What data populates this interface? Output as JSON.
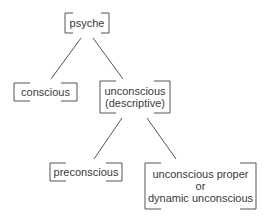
{
  "diagram": {
    "nodes": [
      {
        "id": "psyche",
        "lines": [
          "psyche"
        ]
      },
      {
        "id": "conscious",
        "lines": [
          "conscious"
        ]
      },
      {
        "id": "unconscious-descriptive",
        "lines": [
          "unconscious",
          "(descriptive)"
        ]
      },
      {
        "id": "preconscious",
        "lines": [
          "preconscious"
        ]
      },
      {
        "id": "unconscious-proper",
        "lines": [
          "unconscious proper",
          "or",
          "dynamic unconscious"
        ]
      }
    ],
    "edges": [
      {
        "from": "psyche",
        "to": "conscious"
      },
      {
        "from": "psyche",
        "to": "unconscious-descriptive"
      },
      {
        "from": "unconscious-descriptive",
        "to": "preconscious"
      },
      {
        "from": "unconscious-descriptive",
        "to": "unconscious-proper"
      }
    ],
    "line_color": "#555555"
  }
}
